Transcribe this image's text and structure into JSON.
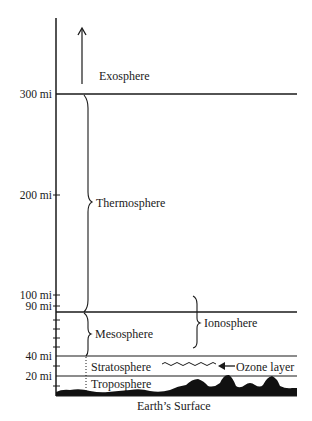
{
  "diagram": {
    "axis_labels": {
      "mi300": "300 mi",
      "mi200": "200 mi",
      "mi100": "100 mi",
      "mi90": "90 mi",
      "mi40": "40 mi",
      "mi20": "20 mi"
    },
    "layers": {
      "exosphere": "Exosphere",
      "thermosphere": "Thermosphere",
      "mesosphere": "Mesosphere",
      "ionosphere": "Ionosphere",
      "stratosphere": "Stratosphere",
      "troposphere": "Troposphere"
    },
    "annotations": {
      "ozone": "Ozone layer",
      "surface": "Earth’s Surface"
    },
    "colors": {
      "ink": "#1a1a1a",
      "background": "#ffffff"
    }
  }
}
